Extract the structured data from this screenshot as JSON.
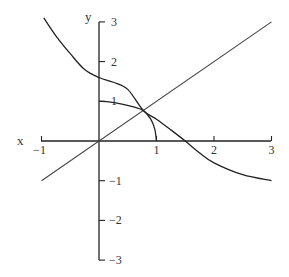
{
  "chart_data": {
    "type": "line",
    "title": "",
    "xlabel": "x",
    "ylabel": "y",
    "xlim": [
      -1,
      3
    ],
    "ylim": [
      -3,
      3
    ],
    "grid": false,
    "x_ticks": [
      -1,
      1,
      2,
      3
    ],
    "x_tick_labels": [
      "−1",
      "1",
      "2",
      "3"
    ],
    "y_ticks": [
      3,
      2,
      1,
      -1,
      -2,
      -3
    ],
    "y_tick_labels": [
      "3",
      "2",
      "1",
      "−1",
      "−2",
      "−3"
    ],
    "series": [
      {
        "name": "identity-line",
        "x": [
          -1,
          3
        ],
        "y": [
          -1,
          3
        ]
      },
      {
        "name": "arc-curve",
        "x": [
          0,
          0.2,
          0.4,
          0.6,
          0.77,
          0.9,
          0.97,
          1.0
        ],
        "y": [
          1.0,
          0.98,
          0.93,
          0.86,
          0.77,
          0.55,
          0.3,
          0.0
        ]
      },
      {
        "name": "decreasing-curve",
        "x": [
          -0.96,
          -0.75,
          -0.5,
          -0.25,
          0,
          0.25,
          0.5,
          0.77,
          1.0,
          1.25,
          1.5,
          1.75,
          2.0,
          2.5,
          3.0
        ],
        "y": [
          3.1,
          2.65,
          2.2,
          1.8,
          1.6,
          1.48,
          1.3,
          0.77,
          0.55,
          0.28,
          0.0,
          -0.3,
          -0.55,
          -0.85,
          -1.0
        ]
      }
    ]
  }
}
